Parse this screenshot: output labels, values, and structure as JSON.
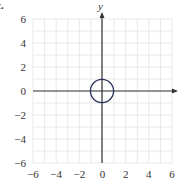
{
  "part_label": "c.",
  "chart_data": {
    "type": "line",
    "title": "",
    "xlabel": "",
    "ylabel": "y",
    "xlim": [
      -6,
      6
    ],
    "ylim": [
      -6,
      6
    ],
    "grid": true,
    "x_ticks": [
      "−6",
      "−4",
      "−2",
      "0",
      "2",
      "4",
      "6"
    ],
    "y_ticks": [
      "6",
      "4",
      "2",
      "0",
      "−2",
      "−4",
      "−6"
    ],
    "series": [
      {
        "name": "circle",
        "shape": "circle",
        "center": [
          0,
          0
        ],
        "radius": 1,
        "color": "#2a2f5a"
      }
    ]
  },
  "colors": {
    "grid": "#e3e3e3",
    "axis": "#333333",
    "curve": "#2a2f5a"
  }
}
